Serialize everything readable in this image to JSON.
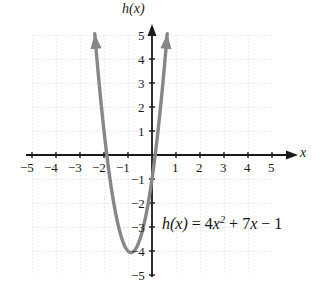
{
  "chart_data": {
    "type": "line",
    "title": "",
    "xlabel": "x",
    "ylabel": "h(x)",
    "equation_text": "h(x) = 4x2 + 7x − 1",
    "equation_parts": {
      "fname": "h",
      "arg": "(x)",
      "equals": "=",
      "term1_coef": "4",
      "term1_var": "x",
      "term1_exp": "2",
      "plus": "+",
      "term2_coef": "7",
      "term2_var": "x",
      "minus": "−",
      "constant": "1"
    },
    "function": "h(x) = 4x^2 + 7x - 1",
    "coefficients": {
      "a": 4,
      "b": 7,
      "c": -1
    },
    "vertex": {
      "x": -0.875,
      "y": -4.0625
    },
    "roots": [
      -1.883,
      0.133
    ],
    "y_intercept": -1,
    "xlim": [
      -5,
      5
    ],
    "ylim": [
      -5,
      5
    ],
    "grid": true,
    "grid_style": "dotted",
    "legend": "none",
    "curve_color": "#878787",
    "axis_color": "#1a1a1a",
    "grid_color": "#bdbdbd",
    "arrowheads": [
      "left-branch-up",
      "right-branch-up"
    ],
    "x_ticks": [
      -5,
      -4,
      -3,
      -2,
      -1,
      1,
      2,
      3,
      4,
      5
    ],
    "x_tick_labels": [
      "−5",
      "−4",
      "−3",
      "−2",
      "−1",
      "1",
      "2",
      "3",
      "4",
      "5"
    ],
    "y_ticks": [
      5,
      4,
      3,
      2,
      1,
      -1,
      -2,
      -3,
      -4,
      -5
    ],
    "y_tick_labels": [
      "5",
      "4",
      "3",
      "2",
      "1",
      "−1",
      "−2",
      "−3",
      "−4",
      "−5"
    ],
    "sampled_points": [
      {
        "x": -2.0,
        "y": 1.0
      },
      {
        "x": -1.883,
        "y": 0.0
      },
      {
        "x": -1.5,
        "y": -2.5
      },
      {
        "x": -1.0,
        "y": -4.0
      },
      {
        "x": -0.875,
        "y": -4.0625
      },
      {
        "x": -0.5,
        "y": -3.5
      },
      {
        "x": 0.0,
        "y": -1.0
      },
      {
        "x": 0.133,
        "y": 0.0
      },
      {
        "x": 0.5,
        "y": 3.5
      }
    ]
  },
  "axis_labels": {
    "y_axis_name": "h(x)",
    "x_axis_name": "x"
  }
}
